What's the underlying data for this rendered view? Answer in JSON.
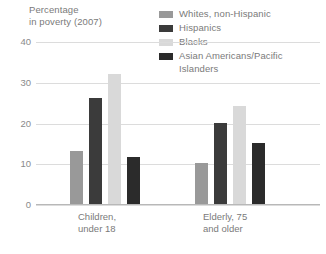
{
  "chart_data": {
    "type": "bar",
    "title": "Percentage\nin poverty (2007)",
    "xlabel": "",
    "ylabel": "Percentage in poverty (2007)",
    "ylim": [
      0,
      40
    ],
    "yticks": [
      0,
      10,
      20,
      30,
      40
    ],
    "grid": true,
    "legend_position": "top-right",
    "categories": [
      "Children,\nunder 18",
      "Elderly, 75\nand older"
    ],
    "series": [
      {
        "name": "Whites, non-Hispanic",
        "color": "#999999",
        "values": [
          13,
          10
        ]
      },
      {
        "name": "Hispanics",
        "color": "#3b3b3b",
        "values": [
          26,
          20
        ]
      },
      {
        "name": "Blacks",
        "color": "#d9d9d9",
        "values": [
          32,
          24
        ]
      },
      {
        "name": "Asian Americans/Pacific\nIslanders",
        "color": "#2b2b2b",
        "values": [
          11.5,
          15
        ]
      }
    ]
  },
  "axis": {
    "title": "Percentage\nin poverty (2007)",
    "ytick_labels": [
      "40",
      "30",
      "20",
      "10",
      "0"
    ]
  },
  "legend": {
    "items": [
      {
        "label": "Whites, non-Hispanic",
        "color": "#999999"
      },
      {
        "label": "Hispanics",
        "color": "#3b3b3b"
      },
      {
        "label": "Blacks",
        "color": "#d9d9d9"
      },
      {
        "label": "Asian Americans/Pacific\nIslanders",
        "color": "#2b2b2b"
      }
    ]
  },
  "xaxis": {
    "labels": [
      "Children,\nunder 18",
      "Elderly, 75\nand older"
    ]
  },
  "colors": {
    "gridline": "#dcdcdc",
    "baseline": "#b8b8b8",
    "text": "#7a7a7a",
    "background": "#ffffff"
  }
}
